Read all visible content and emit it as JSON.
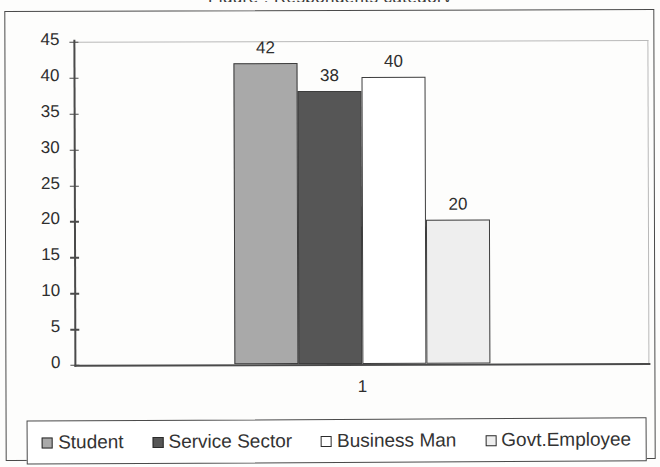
{
  "title_sliver": "Figure : Respondents category",
  "chart_data": {
    "type": "bar",
    "title": "",
    "xlabel": "",
    "ylabel": "",
    "categories": [
      "1"
    ],
    "series": [
      {
        "name": "Student",
        "values": [
          42
        ],
        "color": "#a9a9a9"
      },
      {
        "name": "Service Sector",
        "values": [
          38
        ],
        "color": "#565656"
      },
      {
        "name": "Business Man",
        "values": [
          40
        ],
        "color": "#ffffff"
      },
      {
        "name": "Govt.Employee",
        "values": [
          20
        ],
        "color": "#eeeeee"
      }
    ],
    "ylim": [
      0,
      45
    ],
    "ytick_step": 5,
    "yticks": [
      45,
      40,
      35,
      30,
      25,
      20,
      15,
      10,
      5,
      0
    ],
    "data_labels": [
      42,
      38,
      40,
      20
    ],
    "grid": false,
    "legend_position": "bottom"
  },
  "legend": {
    "items": [
      {
        "label": "Student",
        "swatch": "filled-medium-gray"
      },
      {
        "label": "Service Sector",
        "swatch": "filled-dark-gray"
      },
      {
        "label": "Business Man",
        "swatch": "hollow-white"
      },
      {
        "label": "Govt.Employee",
        "swatch": "hollow-light-gray"
      }
    ]
  }
}
